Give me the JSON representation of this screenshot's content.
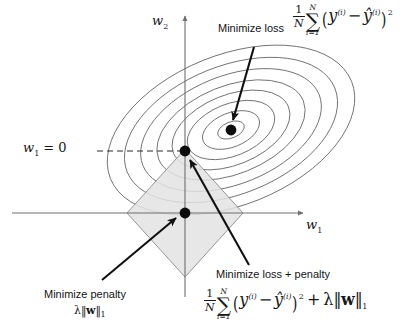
{
  "figure": {
    "background_color": "#ffffff",
    "axes": {
      "x_label": "w",
      "x_label_sub": "1",
      "y_label": "w",
      "y_label_sub": "2",
      "axis_color": "#6e6e6e",
      "origin_px": [
        185,
        213
      ]
    },
    "dashed_guide": {
      "label_text": "w",
      "label_sub": "1",
      "label_eq": "= 0",
      "from_px": [
        97,
        151
      ],
      "to_px": [
        185,
        151
      ]
    },
    "contours": {
      "type": "ellipse-contours",
      "description": "Nested elliptical loss contours (quadratic loss surface)",
      "center_px": [
        231,
        130
      ],
      "rotation_deg": -22,
      "ring_count": 8,
      "stroke_color": "#6b6b6b",
      "ring_radii_rx": [
        14,
        30,
        46,
        62,
        78,
        95,
        112,
        130
      ],
      "ring_radii_ry": [
        8,
        17,
        26,
        35,
        44,
        54,
        64,
        75
      ]
    },
    "constraint_region": {
      "type": "l1-ball-diamond",
      "center_px": [
        185,
        213
      ],
      "half_width_px": 58,
      "half_height_px": 64,
      "fill_color": "#e3e3e3",
      "stroke_color": "#8a8a8a"
    },
    "points": [
      {
        "name": "loss-minimum-point",
        "px": [
          231,
          130
        ],
        "meaning": "unregularized loss minimum"
      },
      {
        "name": "loss-plus-penalty-point",
        "px": [
          185,
          151
        ],
        "meaning": "regularized solution at diamond vertex, w1 = 0"
      },
      {
        "name": "penalty-minimum-point",
        "px": [
          185,
          213
        ],
        "meaning": "penalty minimum at origin"
      }
    ],
    "arrows": [
      {
        "name": "arrow-minimize-loss",
        "from_px": [
          253,
          48
        ],
        "to_px": [
          232,
          122
        ]
      },
      {
        "name": "arrow-minimize-penalty",
        "from_px": [
          103,
          279
        ],
        "to_px": [
          178,
          216
        ]
      },
      {
        "name": "arrow-minimize-loss-penalty",
        "from_px": [
          248,
          264
        ],
        "to_px": [
          189,
          158
        ]
      }
    ]
  },
  "annotations": {
    "minimize_loss": {
      "caption": "Minimize loss",
      "formula_parts": {
        "frac_num": "1",
        "frac_den": "N",
        "sigma": "∑",
        "sum_upper": "N",
        "sum_lower": "i=1",
        "open_paren": "(",
        "y": "y",
        "y_sup": "(i)",
        "minus": "−",
        "yhat": "ŷ",
        "yhat_sup": "(i)",
        "close_paren": ")",
        "power": "2"
      },
      "formula_plain": "1/N ∑_{i=1}^{N} (y^(i) − ŷ^(i))²"
    },
    "minimize_penalty": {
      "caption": "Minimize penalty",
      "formula_parts": {
        "lambda": "λ",
        "norm_open": "‖",
        "w": "w",
        "norm_close": "‖",
        "norm_sub": "1"
      },
      "formula_plain": "λ‖w‖₁"
    },
    "minimize_loss_plus_penalty": {
      "caption": "Minimize loss + penalty",
      "formula_parts": {
        "frac_num": "1",
        "frac_den": "N",
        "sigma": "∑",
        "sum_upper": "N",
        "sum_lower": "i=1",
        "open_paren": "(",
        "y": "y",
        "y_sup": "(i)",
        "minus": "−",
        "yhat": "ŷ",
        "yhat_sup": "(i)",
        "close_paren": ")",
        "power": "2",
        "plus": "+",
        "lambda": "λ",
        "norm_open": "‖",
        "w": "w",
        "norm_close": "‖",
        "norm_sub": "1"
      },
      "formula_plain": "1/N ∑_{i=1}^{N} (y^(i) − ŷ^(i))² + λ‖w‖₁"
    }
  },
  "axis_text": {
    "w1": "w",
    "w1_sub": "1",
    "w2": "w",
    "w2_sub": "2",
    "w1_equals_zero_prefix": "w",
    "w1_equals_zero_sub": "1",
    "w1_equals_zero_suffix": "= 0"
  }
}
